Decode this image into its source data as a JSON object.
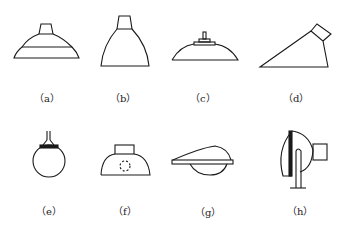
{
  "diagram": {
    "type": "luminaire-shapes",
    "stroke_color": "#1a1a1a",
    "background": "#ffffff",
    "items": [
      {
        "id": "a",
        "label": "（a）",
        "shape": "conical shade with two horizontal bands"
      },
      {
        "id": "b",
        "label": "（b）",
        "shape": "bell-shaped deep shade"
      },
      {
        "id": "c",
        "label": "（c）",
        "shape": "shallow dome with top stem"
      },
      {
        "id": "d",
        "label": "（d）",
        "shape": "angled wedge shade with square socket"
      },
      {
        "id": "e",
        "label": "（e）",
        "shape": "globe pendant"
      },
      {
        "id": "f",
        "label": "（f）",
        "shape": "half-dome with box top and dashed circle"
      },
      {
        "id": "g",
        "label": "（g）",
        "shape": "street-light cobra head"
      },
      {
        "id": "h",
        "label": "（h）",
        "shape": "floodlight spotlight on stand"
      }
    ]
  }
}
